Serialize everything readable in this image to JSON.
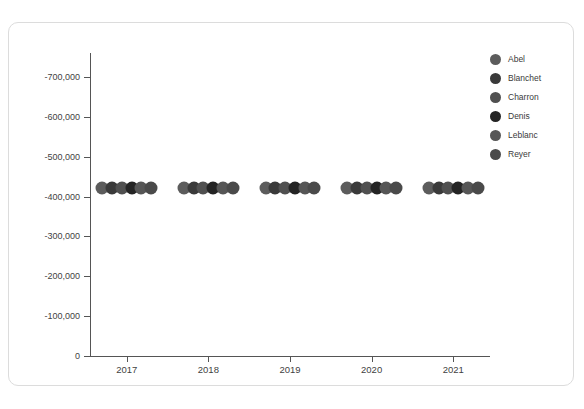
{
  "card": {
    "background": "#ffffff",
    "border_color": "#dcdcdc"
  },
  "chart_data": {
    "type": "scatter",
    "title": "",
    "subtitle": "",
    "xlabel": "",
    "ylabel": "",
    "grid": true,
    "legend_position": "right",
    "xlim": [
      2016.55,
      2021.45
    ],
    "ylim": [
      0,
      -760000
    ],
    "y_axis_inverted": true,
    "x_tick_labels": [
      "2017",
      "2018",
      "2019",
      "2020",
      "2021"
    ],
    "x_tick_values": [
      2017,
      2018,
      2019,
      2020,
      2021
    ],
    "y_tick_labels": [
      "-700,000",
      "-600,000",
      "-500,000",
      "-400,000",
      "-300,000",
      "-200,000",
      "-100,000",
      "0"
    ],
    "y_tick_values": [
      -700000,
      -600000,
      -500000,
      -400000,
      -300000,
      -200000,
      -100000,
      0
    ],
    "categories": [
      2017,
      2018,
      2019,
      2020,
      2021
    ],
    "series": [
      {
        "name": "Abel",
        "color": "#5c5c5c",
        "x": [
          2016.7,
          2017.7,
          2018.7,
          2019.7,
          2020.7
        ],
        "values": [
          -422000,
          -422000,
          -422000,
          -422000,
          -422000
        ]
      },
      {
        "name": "Blanchet",
        "color": "#3a3a3a",
        "x": [
          2016.82,
          2017.82,
          2018.82,
          2019.82,
          2020.82
        ],
        "values": [
          -422000,
          -422000,
          -422000,
          -422000,
          -422000
        ]
      },
      {
        "name": "Charron",
        "color": "#505050",
        "x": [
          2016.94,
          2017.94,
          2018.94,
          2019.94,
          2020.94
        ],
        "values": [
          -422000,
          -422000,
          -422000,
          -422000,
          -422000
        ]
      },
      {
        "name": "Denis",
        "color": "#242424",
        "x": [
          2017.06,
          2018.06,
          2019.06,
          2020.06,
          2021.06
        ],
        "values": [
          -422000,
          -422000,
          -422000,
          -422000,
          -422000
        ]
      },
      {
        "name": "Leblanc",
        "color": "#565656",
        "x": [
          2017.18,
          2018.18,
          2019.18,
          2020.18,
          2021.18
        ],
        "values": [
          -422000,
          -422000,
          -422000,
          -422000,
          -422000
        ]
      },
      {
        "name": "Reyer",
        "color": "#4a4a4a",
        "x": [
          2017.3,
          2018.3,
          2019.3,
          2020.3,
          2021.3
        ],
        "values": [
          -422000,
          -422000,
          -422000,
          -422000,
          -422000
        ]
      }
    ]
  },
  "legend": {
    "items": [
      {
        "label": "Abel",
        "color": "#5c5c5c"
      },
      {
        "label": "Blanchet",
        "color": "#3a3a3a"
      },
      {
        "label": "Charron",
        "color": "#505050"
      },
      {
        "label": "Denis",
        "color": "#242424"
      },
      {
        "label": "Leblanc",
        "color": "#565656"
      },
      {
        "label": "Reyer",
        "color": "#4a4a4a"
      }
    ]
  }
}
